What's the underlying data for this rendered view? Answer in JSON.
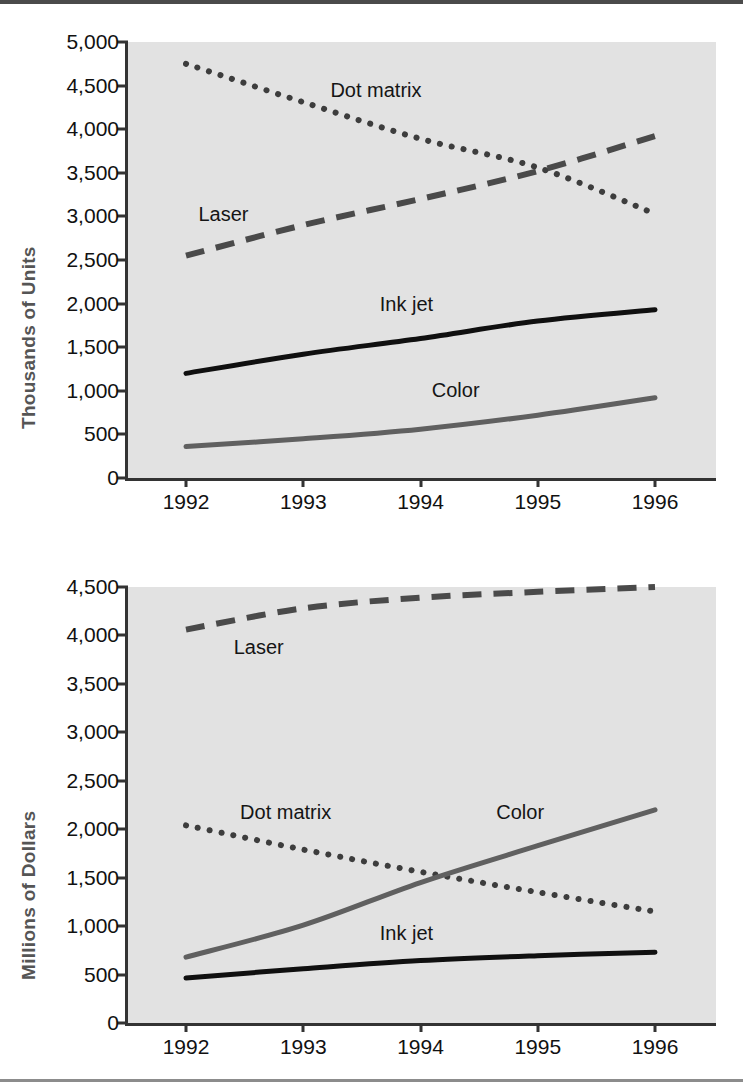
{
  "chart_data": [
    {
      "type": "line",
      "title": "",
      "xlabel": "",
      "ylabel": "Thousands of Units",
      "categories": [
        "1992",
        "1993",
        "1994",
        "1995",
        "1996"
      ],
      "x": [
        1992,
        1993,
        1994,
        1995,
        1996
      ],
      "ylim": [
        0,
        5000
      ],
      "yticks": [
        "0",
        "500",
        "1,000",
        "1,500",
        "2,000",
        "2,500",
        "3,000",
        "3,500",
        "4,000",
        "4,500",
        "5,000"
      ],
      "ytick_values": [
        0,
        500,
        1000,
        1500,
        2000,
        2500,
        3000,
        3500,
        4000,
        4500,
        5000
      ],
      "grid": false,
      "legend": "inline-labels",
      "series": [
        {
          "name": "Dot matrix",
          "style": "dotted",
          "color": "#3d3d3d",
          "label_x": 1993.62,
          "label_y": 4450,
          "values": [
            4750,
            4310,
            3890,
            3560,
            3030
          ]
        },
        {
          "name": "Laser",
          "style": "dashed",
          "color": "#4a4a4a",
          "label_x": 1992.32,
          "label_y": 3030,
          "values": [
            2550,
            2900,
            3200,
            3520,
            3920
          ]
        },
        {
          "name": "Ink jet",
          "style": "solid",
          "color": "#101010",
          "label_x": 1993.88,
          "label_y": 1990,
          "values": [
            1200,
            1420,
            1600,
            1800,
            1930
          ]
        },
        {
          "name": "Color",
          "style": "solid",
          "color": "#606060",
          "label_x": 1994.3,
          "label_y": 1010,
          "values": [
            360,
            450,
            560,
            720,
            920
          ]
        }
      ]
    },
    {
      "type": "line",
      "title": "",
      "xlabel": "",
      "ylabel": "Millions of Dollars",
      "categories": [
        "1992",
        "1993",
        "1994",
        "1995",
        "1996"
      ],
      "x": [
        1992,
        1993,
        1994,
        1995,
        1996
      ],
      "ylim": [
        0,
        4500
      ],
      "yticks": [
        "0",
        "500",
        "1,000",
        "1,500",
        "2,000",
        "2,500",
        "3,000",
        "3,500",
        "4,000",
        "4,500"
      ],
      "ytick_values": [
        0,
        500,
        1000,
        1500,
        2000,
        2500,
        3000,
        3500,
        4000,
        4500
      ],
      "grid": false,
      "legend": "inline-labels",
      "series": [
        {
          "name": "Laser",
          "style": "dashed",
          "color": "#4a4a4a",
          "label_x": 1992.62,
          "label_y": 3880,
          "values": [
            4060,
            4280,
            4390,
            4450,
            4500
          ]
        },
        {
          "name": "Dot matrix",
          "style": "dotted",
          "color": "#3d3d3d",
          "label_x": 1992.85,
          "label_y": 2180,
          "values": [
            2040,
            1790,
            1560,
            1350,
            1150
          ]
        },
        {
          "name": "Color",
          "style": "solid",
          "color": "#606060",
          "label_x": 1994.85,
          "label_y": 2180,
          "values": [
            680,
            1010,
            1450,
            1830,
            2200
          ]
        },
        {
          "name": "Ink jet",
          "style": "solid",
          "color": "#101010",
          "label_x": 1993.88,
          "label_y": 930,
          "values": [
            465,
            560,
            645,
            695,
            730
          ]
        }
      ]
    }
  ]
}
